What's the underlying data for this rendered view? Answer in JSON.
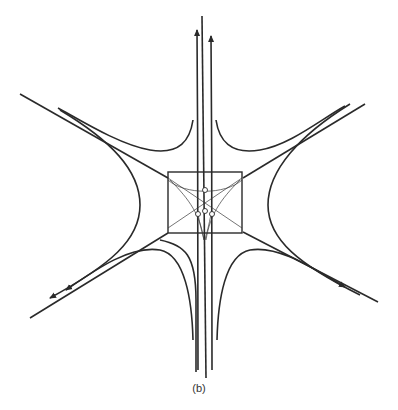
{
  "figure": {
    "caption": "(b)",
    "colors": {
      "line": "#2a2a2a",
      "background": "#ffffff"
    },
    "elements": {
      "central_box": "rectangle",
      "inner_circles": 4,
      "arrows": [
        "up-left-vertical",
        "up-right-vertical",
        "lower-left-1",
        "lower-left-2",
        "lower-right-1",
        "lower-right-2"
      ]
    }
  }
}
